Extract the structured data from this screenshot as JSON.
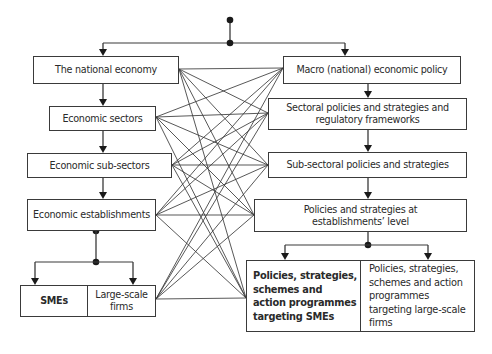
{
  "diagram": {
    "type": "flowchart",
    "left_column": [
      {
        "id": "national_economy",
        "label": "The national economy"
      },
      {
        "id": "economic_sectors",
        "label": "Economic sectors"
      },
      {
        "id": "economic_sub_sectors",
        "label": "Economic sub-sectors"
      },
      {
        "id": "economic_establishments",
        "label": "Economic establishments"
      },
      {
        "id": "smes",
        "label": "SMEs"
      },
      {
        "id": "large_scale_firms",
        "label": "Large-scale firms"
      }
    ],
    "right_column": [
      {
        "id": "macro_policy",
        "label": "Macro (national) economic policy"
      },
      {
        "id": "sectoral_policies",
        "label": "Sectoral policies and strategies and regulatory frameworks"
      },
      {
        "id": "sub_sectoral_policies",
        "label": "Sub-sectoral policies and strategies"
      },
      {
        "id": "establishment_policies",
        "label": "Policies and strategies at establishments’ level"
      },
      {
        "id": "sme_policies",
        "label": "Policies, strategies, schemes and action programmes targeting SMEs"
      },
      {
        "id": "large_firm_policies",
        "label": "Policies, strategies, schemes and action programmes targeting large-scale firms"
      }
    ],
    "hierarchy_edges": [
      [
        "root",
        "national_economy"
      ],
      [
        "root",
        "macro_policy"
      ],
      [
        "national_economy",
        "economic_sectors"
      ],
      [
        "economic_sectors",
        "economic_sub_sectors"
      ],
      [
        "economic_sub_sectors",
        "economic_establishments"
      ],
      [
        "economic_establishments",
        "smes"
      ],
      [
        "economic_establishments",
        "large_scale_firms"
      ],
      [
        "macro_policy",
        "sectoral_policies"
      ],
      [
        "sectoral_policies",
        "sub_sectoral_policies"
      ],
      [
        "sub_sectoral_policies",
        "establishment_policies"
      ],
      [
        "establishment_policies",
        "sme_policies"
      ],
      [
        "establishment_policies",
        "large_firm_policies"
      ]
    ],
    "cross_links": {
      "from": [
        "national_economy",
        "economic_sectors",
        "economic_sub_sectors",
        "economic_establishments",
        "large_scale_firms"
      ],
      "to": [
        "macro_policy",
        "sectoral_policies",
        "sub_sectoral_policies",
        "establishment_policies",
        "sme_policies"
      ],
      "pattern": "all-to-all"
    },
    "colors": {
      "line": "#3a3a3a",
      "box_border": "#3a3a3a",
      "background": "#ffffff"
    }
  }
}
